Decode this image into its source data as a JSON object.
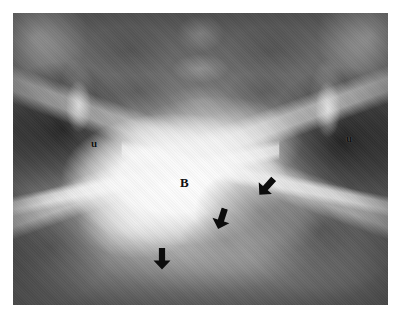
{
  "figure": {
    "type": "radiograph",
    "modality": "x-ray",
    "view": "anteroposterior-pelvis",
    "study": "cystogram",
    "background_color": "#ffffff",
    "plate": {
      "left": 13,
      "top": 13,
      "width": 375,
      "height": 292,
      "tone_dark": "#5a5a5a",
      "tone_mid": "#8a8a8a",
      "tone_bright": "#fdfdfd"
    }
  },
  "annotations": {
    "labels": [
      {
        "id": "bladder-label",
        "text": "B",
        "meaning": "bladder",
        "x": 167,
        "y": 163,
        "font_size": 13,
        "color": "#111111"
      },
      {
        "id": "ureter-label-left",
        "text": "u",
        "meaning": "ureter",
        "side": "left-of-image",
        "x": 78,
        "y": 125,
        "font_size": 11,
        "color": "#111111"
      },
      {
        "id": "ureter-label-right",
        "text": "u",
        "meaning": "ureter",
        "side": "right-of-image",
        "x": 333,
        "y": 120,
        "font_size": 11,
        "color": "#111111"
      }
    ],
    "arrows": [
      {
        "id": "arrow-right",
        "points_to": "filling-defect-superolateral-margin",
        "x": 244,
        "y": 163,
        "rotation_deg": 42,
        "color": "#0d0d0d"
      },
      {
        "id": "arrow-middle",
        "points_to": "filling-defect-medial-margin",
        "x": 199,
        "y": 195,
        "rotation_deg": 18,
        "color": "#0d0d0d"
      },
      {
        "id": "arrow-bottom",
        "points_to": "filling-defect-inferior-margin",
        "x": 140,
        "y": 235,
        "rotation_deg": 0,
        "color": "#0d0d0d"
      }
    ]
  },
  "anatomy": [
    {
      "name": "urinary-bladder",
      "appearance": "opacified-bright"
    },
    {
      "name": "filling-defect",
      "appearance": "grey-indentation"
    },
    {
      "name": "ureter-left",
      "appearance": "opacified-stripe"
    },
    {
      "name": "ureter-right",
      "appearance": "opacified-stripe"
    },
    {
      "name": "sacrum",
      "appearance": "mid-grey-segments"
    },
    {
      "name": "iliac-wing-left",
      "appearance": "bright-cortical"
    },
    {
      "name": "iliac-wing-right",
      "appearance": "bright-cortical"
    },
    {
      "name": "obturator-foramen-left",
      "appearance": "dark-lucency"
    },
    {
      "name": "obturator-foramen-right",
      "appearance": "dark-lucency"
    }
  ]
}
